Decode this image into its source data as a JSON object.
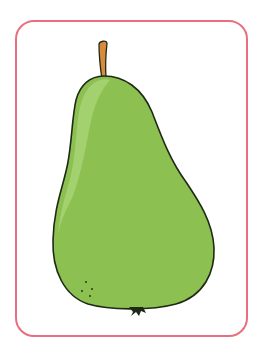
{
  "illustration": {
    "subject": "pear",
    "icon": "pear-icon",
    "colors": {
      "frame_border": "#e8707e",
      "background": "#ffffff",
      "pear_body": "#8cc152",
      "pear_highlight": "#a8d475",
      "outline": "#1f2a14",
      "stem": "#d98a3a"
    }
  }
}
